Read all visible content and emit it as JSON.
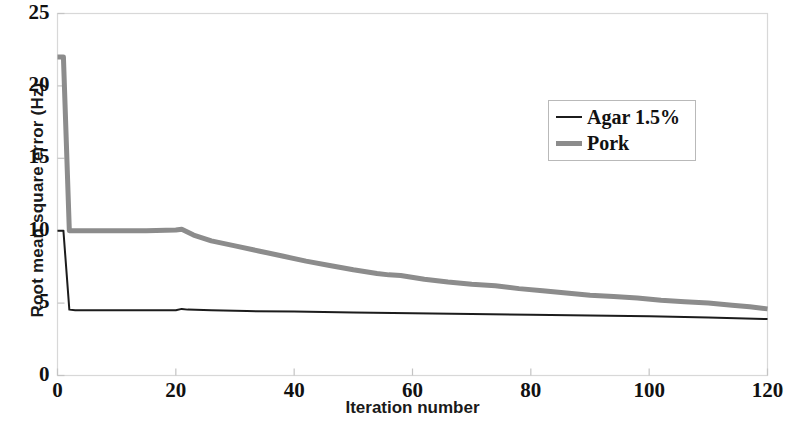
{
  "chart_data": {
    "type": "line",
    "title": "",
    "xlabel": "Iteration number",
    "ylabel": "Root mean square error (Hz)",
    "xlim": [
      0,
      120
    ],
    "ylim": [
      0,
      25
    ],
    "xticks": [
      0,
      20,
      40,
      60,
      80,
      100,
      120
    ],
    "yticks": [
      0,
      5,
      10,
      15,
      20,
      25
    ],
    "xtick_labels": [
      "0",
      "20",
      "40",
      "60",
      "80",
      "100",
      "120"
    ],
    "ytick_labels": [
      "0",
      "5",
      "10",
      "15",
      "20",
      "25"
    ],
    "grid": false,
    "legend_position": "upper right",
    "series": [
      {
        "name": "Agar 1.5%",
        "color": "#1c1c1c",
        "line_width": 2.0,
        "x": [
          0,
          1,
          2,
          3,
          6,
          10,
          15,
          20,
          21,
          22,
          26,
          32,
          40,
          50,
          60,
          70,
          80,
          90,
          100,
          110,
          120
        ],
        "y": [
          10.0,
          10.0,
          4.55,
          4.5,
          4.5,
          4.5,
          4.5,
          4.5,
          4.6,
          4.55,
          4.5,
          4.45,
          4.42,
          4.35,
          4.3,
          4.25,
          4.2,
          4.15,
          4.1,
          4.0,
          3.9
        ]
      },
      {
        "name": "Pork",
        "color": "#8c8c8c",
        "line_width": 5.0,
        "x": [
          0,
          1,
          2,
          3,
          6,
          10,
          15,
          20,
          21,
          23,
          26,
          30,
          34,
          38,
          42,
          46,
          50,
          54,
          56,
          58,
          62,
          66,
          70,
          74,
          78,
          82,
          86,
          90,
          94,
          98,
          102,
          106,
          110,
          114,
          117,
          120
        ],
        "y": [
          22.0,
          22.0,
          10.0,
          10.0,
          10.0,
          10.0,
          10.0,
          10.05,
          10.1,
          9.7,
          9.3,
          8.95,
          8.6,
          8.25,
          7.9,
          7.6,
          7.3,
          7.05,
          6.95,
          6.9,
          6.65,
          6.45,
          6.3,
          6.2,
          6.0,
          5.85,
          5.7,
          5.55,
          5.45,
          5.35,
          5.2,
          5.1,
          5.0,
          4.85,
          4.75,
          4.6
        ]
      }
    ]
  },
  "legend": {
    "entries": [
      {
        "label": "Agar 1.5%"
      },
      {
        "label": "Pork"
      }
    ]
  },
  "axes": {
    "frame_color": "#d8d8d8",
    "background": "#ffffff"
  }
}
